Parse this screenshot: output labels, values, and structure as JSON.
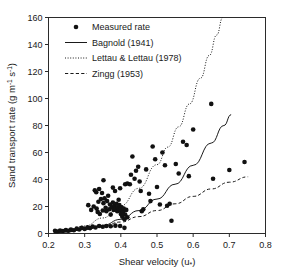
{
  "chart_data": {
    "type": "scatter",
    "title": "",
    "xlabel": "Shear velocity (u*)",
    "ylabel": "Sand transport rate (g m-1 s-1)",
    "xlabel_main": "Shear velocity (u",
    "xlabel_sub": "*",
    "xlabel_close": ")",
    "ylabel_main": "Sand transport rate (g m",
    "ylabel_sup1": "-1",
    "ylabel_mid": " s",
    "ylabel_sup2": "-1",
    "ylabel_close": ")",
    "xlim": [
      0.2,
      0.8
    ],
    "ylim": [
      0,
      160
    ],
    "xticks": [
      0.2,
      0.3,
      0.4,
      0.5,
      0.6,
      0.7,
      0.8
    ],
    "xticklabels": [
      "0.2",
      "0.3",
      "0.4",
      "0.5",
      "0.6",
      "0.7",
      "0.8"
    ],
    "yticks": [
      0,
      20,
      40,
      60,
      80,
      100,
      120,
      140,
      160
    ],
    "yticklabels": [
      "0",
      "20",
      "40",
      "60",
      "80",
      "100",
      "120",
      "140",
      "160"
    ],
    "grid": false,
    "legend_position": "top-left",
    "legend": [
      {
        "label": "Measured rate",
        "marker": "circle",
        "style": "marker"
      },
      {
        "label": "Bagnold (1941)",
        "marker": "line",
        "style": "solid"
      },
      {
        "label": "Lettau & Lettau (1978)",
        "marker": "line",
        "style": "dotted"
      },
      {
        "label": "Zingg (1953)",
        "marker": "line",
        "style": "dashed"
      }
    ],
    "series": [
      {
        "name": "Measured rate",
        "type": "scatter",
        "points": [
          [
            0.218,
            2.0
          ],
          [
            0.225,
            1.5
          ],
          [
            0.232,
            2.2
          ],
          [
            0.24,
            1.8
          ],
          [
            0.248,
            2.6
          ],
          [
            0.255,
            2.0
          ],
          [
            0.262,
            3.0
          ],
          [
            0.27,
            2.4
          ],
          [
            0.278,
            3.6
          ],
          [
            0.285,
            3.0
          ],
          [
            0.292,
            4.2
          ],
          [
            0.3,
            3.4
          ],
          [
            0.308,
            4.6
          ],
          [
            0.315,
            4.0
          ],
          [
            0.322,
            5.2
          ],
          [
            0.33,
            4.4
          ],
          [
            0.34,
            5.6
          ],
          [
            0.35,
            5.0
          ],
          [
            0.36,
            5.6
          ],
          [
            0.372,
            5.4
          ],
          [
            0.385,
            5.8
          ],
          [
            0.398,
            5.6
          ],
          [
            0.41,
            4.2
          ],
          [
            0.31,
            21.0
          ],
          [
            0.318,
            17.5
          ],
          [
            0.325,
            20.0
          ],
          [
            0.328,
            32.0
          ],
          [
            0.332,
            30.5
          ],
          [
            0.333,
            18.5
          ],
          [
            0.336,
            16.0
          ],
          [
            0.338,
            23.5
          ],
          [
            0.34,
            33.0
          ],
          [
            0.342,
            14.5
          ],
          [
            0.345,
            25.5
          ],
          [
            0.348,
            30.0
          ],
          [
            0.35,
            17.0
          ],
          [
            0.352,
            22.5
          ],
          [
            0.355,
            26.0
          ],
          [
            0.358,
            19.0
          ],
          [
            0.36,
            16.5
          ],
          [
            0.362,
            24.0
          ],
          [
            0.365,
            28.0
          ],
          [
            0.368,
            18.0
          ],
          [
            0.37,
            21.5
          ],
          [
            0.372,
            14.0
          ],
          [
            0.375,
            19.5
          ],
          [
            0.378,
            23.0
          ],
          [
            0.38,
            17.5
          ],
          [
            0.382,
            20.5
          ],
          [
            0.384,
            31.5
          ],
          [
            0.386,
            18.5
          ],
          [
            0.388,
            22.0
          ],
          [
            0.39,
            16.5
          ],
          [
            0.392,
            19.0
          ],
          [
            0.394,
            25.0
          ],
          [
            0.396,
            21.0
          ],
          [
            0.398,
            17.0
          ],
          [
            0.4,
            14.5
          ],
          [
            0.402,
            19.5
          ],
          [
            0.404,
            12.5
          ],
          [
            0.406,
            16.0
          ],
          [
            0.408,
            18.5
          ],
          [
            0.41,
            10.5
          ],
          [
            0.412,
            14.0
          ],
          [
            0.415,
            17.5
          ],
          [
            0.418,
            12.0
          ],
          [
            0.352,
            39.5
          ],
          [
            0.378,
            34.0
          ],
          [
            0.398,
            33.5
          ],
          [
            0.412,
            36.5
          ],
          [
            0.418,
            37.0
          ],
          [
            0.425,
            36.5
          ],
          [
            0.428,
            43.5
          ],
          [
            0.432,
            57.0
          ],
          [
            0.438,
            40.5
          ],
          [
            0.442,
            46.5
          ],
          [
            0.448,
            49.5
          ],
          [
            0.452,
            38.5
          ],
          [
            0.455,
            31.5
          ],
          [
            0.458,
            16.5
          ],
          [
            0.462,
            18.0
          ],
          [
            0.47,
            47.5
          ],
          [
            0.478,
            29.5
          ],
          [
            0.482,
            24.0
          ],
          [
            0.488,
            64.5
          ],
          [
            0.495,
            55.0
          ],
          [
            0.5,
            34.5
          ],
          [
            0.508,
            21.5
          ],
          [
            0.515,
            60.0
          ],
          [
            0.522,
            50.5
          ],
          [
            0.528,
            20.5
          ],
          [
            0.535,
            22.0
          ],
          [
            0.54,
            9.5
          ],
          [
            0.552,
            51.5
          ],
          [
            0.56,
            44.5
          ],
          [
            0.572,
            68.0
          ],
          [
            0.582,
            65.5
          ],
          [
            0.588,
            42.5
          ],
          [
            0.6,
            77.0
          ],
          [
            0.65,
            96.0
          ],
          [
            0.655,
            40.5
          ],
          [
            0.7,
            47.0
          ],
          [
            0.742,
            53.0
          ]
        ]
      },
      {
        "name": "Bagnold (1941)",
        "type": "line",
        "style": "solid",
        "points": [
          [
            0.215,
            0.5
          ],
          [
            0.25,
            1.2
          ],
          [
            0.3,
            3.0
          ],
          [
            0.35,
            6.0
          ],
          [
            0.4,
            10.5
          ],
          [
            0.45,
            17.0
          ],
          [
            0.5,
            25.5
          ],
          [
            0.55,
            36.5
          ],
          [
            0.6,
            50.5
          ],
          [
            0.65,
            67.0
          ],
          [
            0.685,
            80.0
          ],
          [
            0.705,
            88.0
          ]
        ]
      },
      {
        "name": "Lettau & Lettau (1978)",
        "type": "line",
        "style": "dotted",
        "points": [
          [
            0.215,
            0.6
          ],
          [
            0.25,
            2.0
          ],
          [
            0.3,
            5.5
          ],
          [
            0.35,
            11.5
          ],
          [
            0.4,
            20.5
          ],
          [
            0.45,
            33.5
          ],
          [
            0.5,
            51.0
          ],
          [
            0.53,
            64.0
          ],
          [
            0.56,
            79.0
          ],
          [
            0.59,
            96.0
          ],
          [
            0.62,
            115.0
          ],
          [
            0.645,
            132.0
          ],
          [
            0.665,
            147.0
          ],
          [
            0.682,
            160.0
          ]
        ]
      },
      {
        "name": "Zingg (1953)",
        "type": "line",
        "style": "dashed",
        "points": [
          [
            0.215,
            0.4
          ],
          [
            0.25,
            1.2
          ],
          [
            0.3,
            3.0
          ],
          [
            0.35,
            5.5
          ],
          [
            0.4,
            8.5
          ],
          [
            0.45,
            12.5
          ],
          [
            0.5,
            17.0
          ],
          [
            0.55,
            22.0
          ],
          [
            0.6,
            27.5
          ],
          [
            0.65,
            33.0
          ],
          [
            0.7,
            38.0
          ],
          [
            0.752,
            42.0
          ]
        ]
      }
    ]
  }
}
